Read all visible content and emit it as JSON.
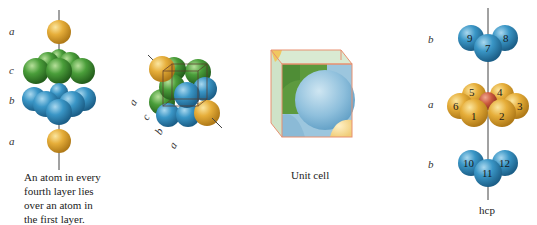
{
  "figure_ccp_stack": {
    "layer_labels": [
      "a",
      "c",
      "b",
      "a"
    ],
    "caption_lines": [
      "An atom in every",
      "fourth layer lies",
      "over an atom in",
      "the first layer."
    ]
  },
  "figure_ccp_cube": {
    "diagonal_labels": [
      "a",
      "c",
      "b",
      "a"
    ]
  },
  "figure_unit_cell": {
    "caption": "Unit cell"
  },
  "figure_hcp": {
    "layer_labels": [
      "b",
      "a",
      "b"
    ],
    "atom_numbers": [
      "9",
      "8",
      "7",
      "5",
      "4",
      "6",
      "3",
      "1",
      "2",
      "10",
      "12",
      "11"
    ],
    "caption": "hcp"
  },
  "colors": {
    "layer_a": "#e0a830",
    "layer_b": "#2f8fc0",
    "layer_c": "#3f9a35",
    "center_atom": "#c8553a"
  }
}
